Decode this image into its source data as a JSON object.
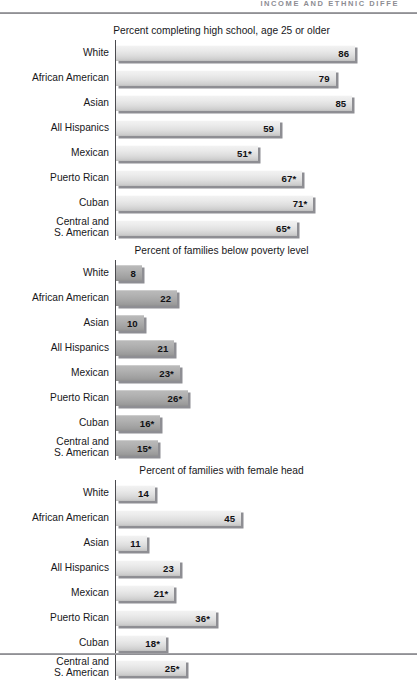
{
  "page": {
    "running_head": "INCOME AND ETHNIC DIFFE",
    "categories": [
      "White",
      "African American",
      "Asian",
      "All Hispanics",
      "Mexican",
      "Puerto Rican",
      "Cuban",
      "Central and\nS. American"
    ]
  },
  "chart_data": [
    {
      "type": "bar",
      "orientation": "horizontal",
      "title": "Percent completing high school, age 25 or older",
      "xlabel": "",
      "ylabel": "",
      "xlim": [
        0,
        100
      ],
      "grid": false,
      "legend": false,
      "bar_style": "light",
      "categories": [
        "White",
        "African American",
        "Asian",
        "All Hispanics",
        "Mexican",
        "Puerto Rican",
        "Cuban",
        "Central and\nS. American"
      ],
      "values": [
        86,
        79,
        85,
        59,
        51,
        67,
        71,
        65
      ],
      "labels": [
        "86",
        "79",
        "85",
        "59",
        "51*",
        "67*",
        "71*",
        "65*"
      ]
    },
    {
      "type": "bar",
      "orientation": "horizontal",
      "title": "Percent of families below poverty level",
      "xlabel": "",
      "ylabel": "",
      "xlim": [
        0,
        100
      ],
      "grid": false,
      "legend": false,
      "bar_style": "dark",
      "categories": [
        "White",
        "African American",
        "Asian",
        "All Hispanics",
        "Mexican",
        "Puerto Rican",
        "Cuban",
        "Central and\nS. American"
      ],
      "values": [
        8,
        22,
        10,
        21,
        23,
        26,
        16,
        15
      ],
      "labels": [
        "8",
        "22",
        "10",
        "21",
        "23*",
        "26*",
        "16*",
        "15*"
      ]
    },
    {
      "type": "bar",
      "orientation": "horizontal",
      "title": "Percent of families with female head",
      "xlabel": "",
      "ylabel": "",
      "xlim": [
        0,
        100
      ],
      "grid": false,
      "legend": false,
      "bar_style": "light",
      "categories": [
        "White",
        "African American",
        "Asian",
        "All Hispanics",
        "Mexican",
        "Puerto Rican",
        "Cuban",
        "Central and\nS. American"
      ],
      "values": [
        14,
        45,
        11,
        23,
        21,
        36,
        18,
        25
      ],
      "labels": [
        "14",
        "45",
        "11",
        "23",
        "21*",
        "36*",
        "18*",
        "25*"
      ]
    }
  ]
}
